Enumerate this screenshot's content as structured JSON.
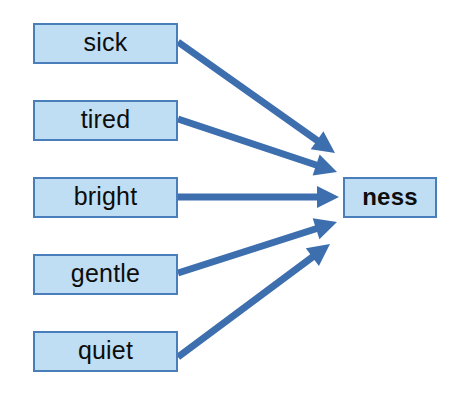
{
  "diagram": {
    "type": "convergent-arrow-diagram",
    "background_color": "#ffffff",
    "box_fill_color": "#BFDDF3",
    "box_border_color": "#4A7EBB",
    "arrow_color": "#3D6FAF",
    "text_color": "#0d0d0d",
    "source_nodes": [
      {
        "label": "sick",
        "x": 33,
        "y": 23,
        "w": 145,
        "h": 41
      },
      {
        "label": "tired",
        "x": 33,
        "y": 100,
        "w": 145,
        "h": 41
      },
      {
        "label": "bright",
        "x": 33,
        "y": 177,
        "w": 145,
        "h": 41
      },
      {
        "label": "gentle",
        "x": 33,
        "y": 254,
        "w": 145,
        "h": 41
      },
      {
        "label": "quiet",
        "x": 33,
        "y": 331,
        "w": 145,
        "h": 41
      }
    ],
    "target_node": {
      "label": "ness",
      "x": 343,
      "y": 177,
      "w": 94,
      "h": 41
    },
    "arrows": [
      {
        "from": "sick",
        "to": "ness",
        "x1": 178,
        "y1": 42,
        "x2": 335,
        "y2": 153
      },
      {
        "from": "tired",
        "to": "ness",
        "x1": 178,
        "y1": 119,
        "x2": 337,
        "y2": 172
      },
      {
        "from": "bright",
        "to": "ness",
        "x1": 178,
        "y1": 197,
        "x2": 339,
        "y2": 197
      },
      {
        "from": "gentle",
        "to": "ness",
        "x1": 178,
        "y1": 273,
        "x2": 337,
        "y2": 222
      },
      {
        "from": "quiet",
        "to": "ness",
        "x1": 178,
        "y1": 357,
        "x2": 330,
        "y2": 244
      }
    ]
  }
}
